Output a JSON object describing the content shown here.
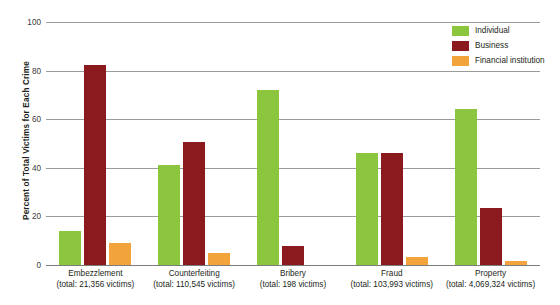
{
  "chart_data": {
    "type": "bar",
    "title": "",
    "subtitle": "",
    "xlabel": "",
    "ylabel": "Percent of Total Victims for Each Crime",
    "ylim": [
      0,
      100
    ],
    "yticks": [
      0,
      20,
      40,
      60,
      80,
      100
    ],
    "ytick_labels": [
      "0",
      "20",
      "40",
      "60",
      "80",
      "100"
    ],
    "grid": true,
    "legend_position": "top-right",
    "categories": [
      "Embezzlement",
      "Counterfeiting",
      "Bribery",
      "Fraud",
      "Property"
    ],
    "category_sublabels": [
      "(total: 21,356 victims)",
      "(total: 110,545 victims)",
      "(total: 198 victims)",
      "(total: 103,993 victims)",
      "(total: 4,069,324 victims)"
    ],
    "category_totals": [
      21356,
      110545,
      198,
      103993,
      4069324
    ],
    "series": [
      {
        "name": "Individual",
        "color": "#8CC63E",
        "values": [
          14,
          41,
          72,
          46,
          64
        ]
      },
      {
        "name": "Business",
        "color": "#8B1A1E",
        "values": [
          82.5,
          50.5,
          8,
          46,
          23.5
        ]
      },
      {
        "name": "Financial institution",
        "color": "#F2A33C",
        "values": [
          9,
          5,
          0,
          3.5,
          1.5
        ]
      }
    ]
  },
  "colors": {
    "individual": "#8CC63E",
    "business": "#8B1A1E",
    "financial_institution": "#F2A33C",
    "gridline": "#9a9a9a",
    "axis": "#7d7d7d",
    "text": "#231f20",
    "background": "#ffffff"
  }
}
